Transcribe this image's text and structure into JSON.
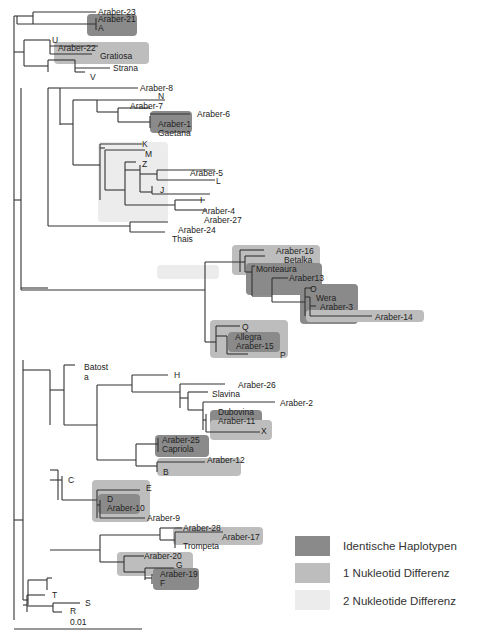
{
  "figure": {
    "type": "phylogenetic-tree",
    "scale_bar_label": "0.01",
    "taxa": [
      "Araber-23",
      "Araber-21",
      "A",
      "U",
      "Araber-22",
      "Gratiosa",
      "Strana",
      "V",
      "Araber-8",
      "N",
      "Araber-7",
      "Araber-6",
      "Araber-1",
      "Gaetana",
      "K",
      "M",
      "Z",
      "Araber-5",
      "L",
      "J",
      "I",
      "Araber-4",
      "Araber-27",
      "Araber-24",
      "Thais",
      "Araber-16",
      "Betalka",
      "Monteaura",
      "Araber13",
      "O",
      "Wera",
      "Araber-3",
      "Araber-14",
      "Q",
      "Allegra",
      "Araber-15",
      "P",
      "Batost a",
      "H",
      "Araber-26",
      "Slavina",
      "Araber-2",
      "Dubovina",
      "Araber-11",
      "X",
      "Araber-25",
      "Capriola",
      "Araber-12",
      "B",
      "C",
      "E",
      "D",
      "Araber-10",
      "Araber-9",
      "Araber-28",
      "Araber-17",
      "Trompeta",
      "Araber-20",
      "G",
      "Araber-19",
      "F",
      "T",
      "S",
      "R"
    ],
    "groups": {
      "identical": [
        [
          "Araber-21",
          "A"
        ],
        [
          "Araber-1",
          "Gaetana"
        ],
        [
          "O",
          "Wera",
          "Araber-3"
        ],
        [
          "Allegra",
          "Araber-15"
        ],
        [
          "Dubovina",
          "Araber-11"
        ],
        [
          "Araber-25",
          "Capriola"
        ],
        [
          "D",
          "Araber-10"
        ],
        [
          "Araber-19",
          "F"
        ],
        [
          "Monteaura",
          "Araber13"
        ]
      ],
      "one_difference": [
        [
          "Araber-22",
          "Gratiosa"
        ],
        [
          "Araber-16",
          "Betalka",
          "Monteaura",
          "Araber13",
          "O",
          "Wera",
          "Araber-3"
        ],
        [
          "Araber-14"
        ],
        [
          "Q",
          "Allegra",
          "Araber-15",
          "P"
        ],
        [
          "Dubovina",
          "Araber-11",
          "X"
        ],
        [
          "Araber-12",
          "B"
        ],
        [
          "E",
          "D",
          "Araber-10",
          "Araber-9"
        ],
        [
          "Araber-17",
          "Trompeta"
        ],
        [
          "Araber-20",
          "G",
          "Araber-19",
          "F"
        ]
      ],
      "two_differences": [
        [
          "K",
          "M",
          "Z",
          "Araber-5",
          "L",
          "J",
          "I",
          "Araber-4",
          "Araber-27"
        ],
        [
          "Araber-28",
          "Araber-17",
          "Trompeta"
        ]
      ]
    }
  },
  "legend": {
    "items": [
      {
        "label": "Identische Haplotypen",
        "color": "#8a8a8a"
      },
      {
        "label": "1 Nukleotid Differenz",
        "color": "#bdbdbd"
      },
      {
        "label": "2 Nukleotide Differenz",
        "color": "#ececec"
      }
    ]
  },
  "colors": {
    "identical": "#8a8a8a",
    "one_difference": "#bdbdbd",
    "two_differences": "#ececec",
    "branch": "#333333"
  }
}
